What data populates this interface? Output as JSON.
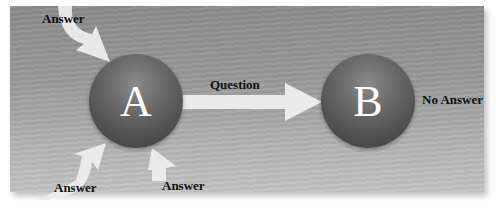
{
  "diagram": {
    "nodes": [
      {
        "id": "A",
        "letter": "A"
      },
      {
        "id": "B",
        "letter": "B"
      }
    ],
    "labels": {
      "answer_top": "Answer",
      "answer_bottom_left": "Answer",
      "answer_bottom_right": "Answer",
      "question": "Question",
      "no_answer": "No Answer"
    },
    "edges": [
      {
        "from": "outside",
        "to": "A",
        "label": "Answer"
      },
      {
        "from": "outside",
        "to": "A",
        "label": "Answer"
      },
      {
        "from": "outside",
        "to": "A",
        "label": "Answer"
      },
      {
        "from": "A",
        "to": "B",
        "label": "Question"
      }
    ],
    "colors": {
      "background": "#9a9a9a",
      "sphere": "#5a5a5a",
      "arrow": "#ededed",
      "text": "#111111"
    }
  }
}
